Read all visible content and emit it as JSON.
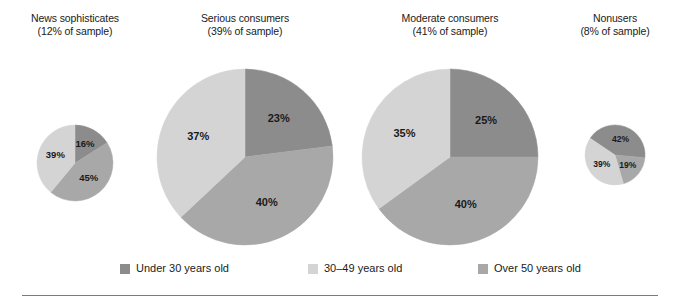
{
  "chart_data": {
    "type": "pie",
    "title": "",
    "subtitle": "",
    "xlabel": "",
    "ylabel": "",
    "grid": false,
    "legend_position": "bottom",
    "categories": [
      "Under 30 years old",
      "30–49 years old",
      "Over 50 years old"
    ],
    "colors": {
      "under30": "#8c8c8c",
      "age30to49": "#d4d4d4",
      "over50": "#a8a8a8",
      "text": "#1a1a1a",
      "rule": "#7a7a7a",
      "background": "#ffffff"
    },
    "charts": [
      {
        "id": "news-sophisticates",
        "group": "News sophisticates",
        "sample": "(12% of sample)",
        "radius": 38,
        "cx": 75,
        "cy": 163,
        "start_angle": 0,
        "slices": [
          {
            "key": "under30",
            "label": "16%",
            "value": 16,
            "color": "#8c8c8c"
          },
          {
            "key": "over50",
            "label": "45%",
            "value": 45,
            "color": "#a8a8a8"
          },
          {
            "key": "age30to49",
            "label": "39%",
            "value": 39,
            "color": "#d4d4d4"
          }
        ]
      },
      {
        "id": "serious-consumers",
        "group": "Serious consumers",
        "sample": "(39% of sample)",
        "radius": 88,
        "cx": 245,
        "cy": 157,
        "start_angle": 0,
        "slices": [
          {
            "key": "under30",
            "label": "23%",
            "value": 23,
            "color": "#8c8c8c"
          },
          {
            "key": "over50",
            "label": "40%",
            "value": 40,
            "color": "#a8a8a8"
          },
          {
            "key": "age30to49",
            "label": "37%",
            "value": 37,
            "color": "#d4d4d4"
          }
        ]
      },
      {
        "id": "moderate-consumers",
        "group": "Moderate consumers",
        "sample": "(41% of sample)",
        "radius": 88,
        "cx": 450,
        "cy": 157,
        "start_angle": 0,
        "slices": [
          {
            "key": "under30",
            "label": "25%",
            "value": 25,
            "color": "#8c8c8c"
          },
          {
            "key": "over50",
            "label": "40%",
            "value": 40,
            "color": "#a8a8a8"
          },
          {
            "key": "age30to49",
            "label": "35%",
            "value": 35,
            "color": "#d4d4d4"
          }
        ]
      },
      {
        "id": "nonusers",
        "group": "Nonusers",
        "sample": "(8% of sample)",
        "radius": 30,
        "cx": 615,
        "cy": 155,
        "start_angle": -56,
        "slices": [
          {
            "key": "under30",
            "label": "42%",
            "value": 42,
            "color": "#8c8c8c"
          },
          {
            "key": "over50",
            "label": "19%",
            "value": 19,
            "color": "#a8a8a8"
          },
          {
            "key": "age30to49",
            "label": "39%",
            "value": 39,
            "color": "#d4d4d4"
          }
        ]
      }
    ],
    "titles": [
      {
        "line1": "News sophisticates",
        "line2": "(12% of sample)",
        "x": 75,
        "y": 12
      },
      {
        "line1": "Serious consumers",
        "line2": "(39% of sample)",
        "x": 245,
        "y": 12
      },
      {
        "line1": "Moderate consumers",
        "line2": "(41% of sample)",
        "x": 450,
        "y": 12
      },
      {
        "line1": "Nonusers",
        "line2": "(8% of sample)",
        "x": 615,
        "y": 12
      }
    ],
    "legend": [
      {
        "label": "Under 30 years old",
        "color": "#8c8c8c",
        "x": 120
      },
      {
        "label": "30–49 years old",
        "color": "#d4d4d4",
        "x": 308
      },
      {
        "label": "Over 50 years old",
        "color": "#a8a8a8",
        "x": 478
      }
    ]
  }
}
